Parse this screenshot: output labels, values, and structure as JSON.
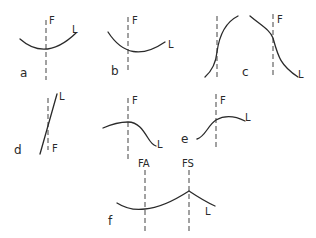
{
  "panels": {
    "a": {
      "id": "a",
      "line_label": "F",
      "curve_label": "L"
    },
    "b": {
      "id": "b",
      "line_label": "F",
      "curve_label": "L"
    },
    "c": {
      "id": "c",
      "line_label": "F",
      "curve_label": "L"
    },
    "d": {
      "id": "d",
      "line_label": "F",
      "curve_label": "L"
    },
    "e_left": {
      "line_label": "F",
      "curve_label": "L"
    },
    "e": {
      "id": "e",
      "line_label": "F",
      "curve_label": "L"
    },
    "f": {
      "id": "f",
      "line_label_1": "FA",
      "line_label_2": "FS",
      "curve_label": "L"
    }
  },
  "colors": {
    "stroke": "#2a2a2a",
    "dash": "#555555",
    "background": "#ffffff"
  }
}
